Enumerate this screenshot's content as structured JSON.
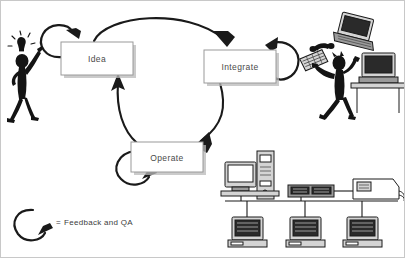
{
  "diagram": {
    "nodes": [
      {
        "id": "idea",
        "label": "Idea",
        "x": 60,
        "y": 41,
        "w": 72,
        "h": 33
      },
      {
        "id": "integrate",
        "label": "Integrate",
        "x": 203,
        "y": 49,
        "w": 72,
        "h": 33
      },
      {
        "id": "operate",
        "label": "Operate",
        "x": 130,
        "y": 141,
        "w": 72,
        "h": 30
      }
    ],
    "connections": [
      {
        "from": "idea",
        "to": "integrate",
        "kind": "curved-arrow"
      },
      {
        "from": "integrate",
        "to": "operate",
        "kind": "curved-arrow"
      },
      {
        "from": "operate",
        "to": "idea",
        "kind": "curved-arrow"
      }
    ],
    "self_loops": [
      {
        "node": "idea",
        "position": "top-left"
      },
      {
        "node": "integrate",
        "position": "top-right"
      },
      {
        "node": "operate",
        "position": "bottom-left"
      }
    ],
    "legend": {
      "symbol": "feedback-loop-arrow",
      "equals": "=",
      "text": "Feedback and QA"
    },
    "illustrations": [
      {
        "id": "idea-person",
        "name": "stick-figure-with-lightbulb",
        "description": "stick figure raising arm with lightbulb idea"
      },
      {
        "id": "integrate-person",
        "name": "frustrated-stick-figure",
        "description": "stick figure with flying keyboard, laptop, phone handset and desk computer"
      },
      {
        "id": "operate-network",
        "name": "computer-network",
        "description": "server tower, monitor, network hub, printer and three client PCs on a bus"
      }
    ],
    "colors": {
      "ink": "#1a1a1a",
      "box_border": "#9a9a9a",
      "box_shadow": "#b9b9b9",
      "label_text": "#4a4a4a",
      "legend_text": "#3d3d3d",
      "background": "#ffffff",
      "frame": "#c8c8c8"
    }
  }
}
